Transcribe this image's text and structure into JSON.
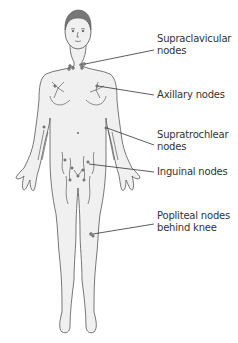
{
  "diagram": {
    "labels": [
      {
        "id": "supraclavicular",
        "line1": "Supraclavicular",
        "line2": "nodes"
      },
      {
        "id": "axillary",
        "line1": "Axillary nodes",
        "line2": ""
      },
      {
        "id": "supratrochlear",
        "line1": "Supratrochlear",
        "line2": "nodes"
      },
      {
        "id": "inguinal",
        "line1": "Inguinal nodes",
        "line2": ""
      },
      {
        "id": "popliteal",
        "line1": "Popliteal nodes",
        "line2": "behind knee"
      }
    ],
    "colors": {
      "outline": "#555555",
      "skin": "#f0f0f0",
      "leader": "#333333",
      "text": "#333333"
    }
  }
}
